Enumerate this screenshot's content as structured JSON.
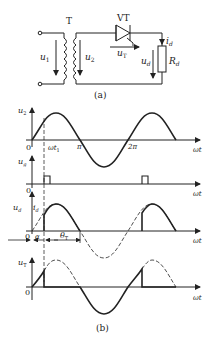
{
  "circuit": {
    "transformer_label": "T",
    "thyristor_label": "VT",
    "primary_voltage": "u",
    "primary_sub": "1",
    "secondary_voltage": "u",
    "secondary_sub": "2",
    "thyristor_voltage": "u",
    "thyristor_sub": "T",
    "load_voltage": "u",
    "load_sub": "d",
    "load_current": "i",
    "load_current_sub": "d",
    "resistor": "R",
    "resistor_sub": "d",
    "caption": "(a)"
  },
  "waveforms": {
    "caption": "(b)",
    "x_axis": "ωt",
    "origin": "0",
    "u2": {
      "label": "u",
      "sub": "2",
      "tick_wt1": "ωt",
      "tick_wt1_sub": "1",
      "tick_pi": "π",
      "tick_2pi": "2π"
    },
    "ug": {
      "label": "u",
      "sub": "g"
    },
    "ud": {
      "label": "u",
      "sub": "d",
      "label2": "i",
      "sub2": "d",
      "alpha": "α",
      "theta": "θ",
      "theta_sub": "T"
    },
    "uT": {
      "label": "u",
      "sub": "T"
    }
  },
  "colors": {
    "line": "#222222",
    "dash": "#333333"
  }
}
